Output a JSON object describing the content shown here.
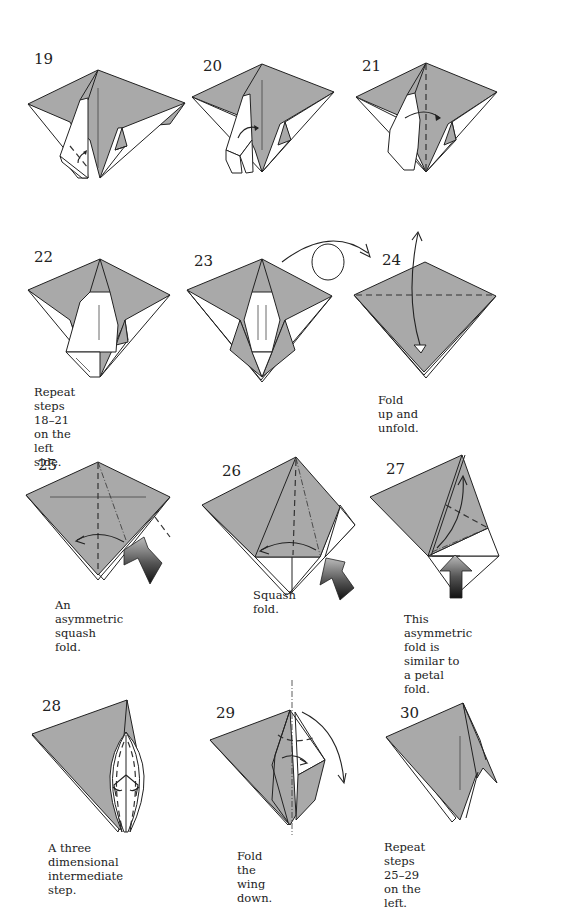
{
  "page": {
    "paper_gray": "#a9a9a9",
    "line_color": "#222222"
  },
  "steps": [
    {
      "number": "19",
      "caption": ""
    },
    {
      "number": "20",
      "caption": ""
    },
    {
      "number": "21",
      "caption": ""
    },
    {
      "number": "22",
      "caption_lines": [
        "Repeat steps 18–21",
        "on the left side."
      ]
    },
    {
      "number": "23",
      "caption": ""
    },
    {
      "number": "24",
      "caption_lines": [
        "Fold up and unfold."
      ]
    },
    {
      "number": "25",
      "caption_lines": [
        "An asymmetric",
        "squash fold."
      ]
    },
    {
      "number": "26",
      "caption_lines": [
        "Squash fold."
      ]
    },
    {
      "number": "27",
      "caption_lines": [
        "This asymmetric",
        "fold is similar to",
        "a petal fold."
      ]
    },
    {
      "number": "28",
      "caption_lines": [
        "A three dimensional",
        "intermediate step."
      ]
    },
    {
      "number": "29",
      "caption_lines": [
        "Fold the wing down."
      ]
    },
    {
      "number": "30",
      "caption_lines": [
        "Repeat steps",
        "25–29 on the left."
      ]
    }
  ],
  "symbols": {
    "turn_over": "turn-over-symbol between steps 23 and 24"
  }
}
